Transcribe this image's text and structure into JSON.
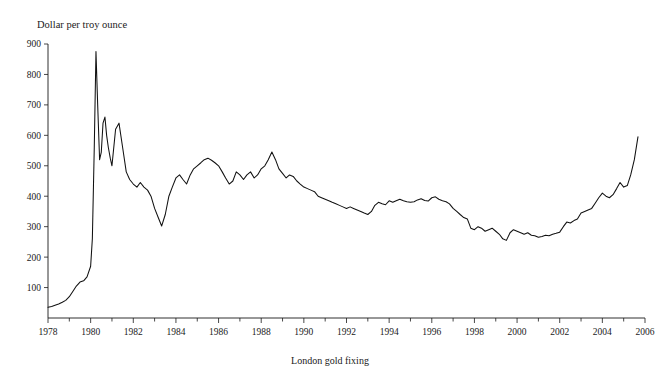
{
  "figure": {
    "title": "CHART 3: Movement in Gold Prices",
    "y_axis_caption": "Dollar per troy ounce",
    "x_axis_caption": "London gold fixing"
  },
  "chart_data": {
    "type": "line",
    "title": "CHART 3: Movement in Gold Prices",
    "subtitle": "",
    "xlabel": "London gold fixing",
    "ylabel": "Dollar per troy ounce",
    "xlim": [
      1978,
      2006
    ],
    "ylim": [
      0,
      900
    ],
    "grid": false,
    "legend": null,
    "x_major_ticks": [
      1978,
      1980,
      1982,
      1984,
      1986,
      1988,
      1990,
      1992,
      1994,
      1996,
      1998,
      2000,
      2002,
      2004,
      2006
    ],
    "x_tick_labels": [
      "1978",
      "1980",
      "1982",
      "1984",
      "1986",
      "1988",
      "1990",
      "1992",
      "1994",
      "1996",
      "1998",
      "2000",
      "2002",
      "2004",
      "2006"
    ],
    "x_minor_tick_interval": 1,
    "y_major_ticks": [
      100,
      200,
      300,
      400,
      500,
      600,
      700,
      800,
      900
    ],
    "y_tick_labels": [
      "100",
      "200",
      "300",
      "400",
      "500",
      "600",
      "700",
      "800",
      "900"
    ],
    "series": [
      {
        "name": "London gold fixing",
        "color": "#111111",
        "x": [
          1978.0,
          1978.17,
          1978.33,
          1978.5,
          1978.67,
          1978.83,
          1979.0,
          1979.17,
          1979.33,
          1979.5,
          1979.67,
          1979.83,
          1980.0,
          1980.08,
          1980.17,
          1980.25,
          1980.33,
          1980.42,
          1980.5,
          1980.58,
          1980.67,
          1980.75,
          1980.83,
          1980.92,
          1981.0,
          1981.17,
          1981.33,
          1981.5,
          1981.67,
          1981.83,
          1982.0,
          1982.17,
          1982.33,
          1982.5,
          1982.67,
          1982.83,
          1983.0,
          1983.17,
          1983.33,
          1983.5,
          1983.67,
          1983.83,
          1984.0,
          1984.17,
          1984.33,
          1984.5,
          1984.67,
          1984.83,
          1985.0,
          1985.17,
          1985.33,
          1985.5,
          1985.67,
          1985.83,
          1986.0,
          1986.17,
          1986.33,
          1986.5,
          1986.67,
          1986.83,
          1987.0,
          1987.17,
          1987.33,
          1987.5,
          1987.67,
          1987.83,
          1988.0,
          1988.17,
          1988.33,
          1988.5,
          1988.67,
          1988.83,
          1989.0,
          1989.17,
          1989.33,
          1989.5,
          1989.67,
          1989.83,
          1990.0,
          1990.17,
          1990.33,
          1990.5,
          1990.67,
          1990.83,
          1991.0,
          1991.17,
          1991.33,
          1991.5,
          1991.67,
          1991.83,
          1992.0,
          1992.17,
          1992.33,
          1992.5,
          1992.67,
          1992.83,
          1993.0,
          1993.17,
          1993.33,
          1993.5,
          1993.67,
          1993.83,
          1994.0,
          1994.17,
          1994.33,
          1994.5,
          1994.67,
          1994.83,
          1995.0,
          1995.17,
          1995.33,
          1995.5,
          1995.67,
          1995.83,
          1996.0,
          1996.17,
          1996.33,
          1996.5,
          1996.67,
          1996.83,
          1997.0,
          1997.17,
          1997.33,
          1997.5,
          1997.67,
          1997.83,
          1998.0,
          1998.17,
          1998.33,
          1998.5,
          1998.67,
          1998.83,
          1999.0,
          1999.17,
          1999.33,
          1999.5,
          1999.67,
          1999.83,
          2000.0,
          2000.17,
          2000.33,
          2000.5,
          2000.67,
          2000.83,
          2001.0,
          2001.17,
          2001.33,
          2001.5,
          2001.67,
          2001.83,
          2002.0,
          2002.17,
          2002.33,
          2002.5,
          2002.67,
          2002.83,
          2003.0,
          2003.17,
          2003.33,
          2003.5,
          2003.67,
          2003.83,
          2004.0,
          2004.17,
          2004.33,
          2004.5,
          2004.67,
          2004.83,
          2005.0,
          2005.17,
          2005.33,
          2005.5,
          2005.67
        ],
        "y": [
          35,
          38,
          42,
          46,
          52,
          58,
          70,
          88,
          105,
          118,
          122,
          135,
          170,
          260,
          560,
          875,
          700,
          520,
          545,
          640,
          660,
          600,
          560,
          525,
          500,
          620,
          640,
          560,
          480,
          455,
          440,
          430,
          445,
          430,
          420,
          400,
          360,
          330,
          302,
          340,
          400,
          430,
          460,
          470,
          455,
          440,
          470,
          490,
          500,
          510,
          520,
          525,
          518,
          510,
          500,
          480,
          460,
          440,
          450,
          480,
          470,
          455,
          470,
          480,
          460,
          470,
          490,
          500,
          520,
          545,
          520,
          490,
          475,
          460,
          470,
          465,
          450,
          440,
          430,
          425,
          420,
          415,
          400,
          395,
          390,
          385,
          380,
          375,
          370,
          365,
          360,
          365,
          360,
          355,
          350,
          345,
          340,
          350,
          370,
          380,
          375,
          372,
          385,
          380,
          385,
          390,
          385,
          382,
          380,
          382,
          388,
          392,
          386,
          384,
          395,
          398,
          390,
          385,
          382,
          375,
          360,
          350,
          340,
          330,
          325,
          295,
          290,
          300,
          295,
          285,
          290,
          295,
          285,
          275,
          260,
          255,
          280,
          290,
          285,
          280,
          275,
          280,
          272,
          270,
          265,
          268,
          272,
          270,
          275,
          278,
          282,
          300,
          315,
          312,
          320,
          325,
          345,
          350,
          355,
          360,
          378,
          395,
          410,
          400,
          395,
          405,
          425,
          445,
          430,
          435,
          470,
          520,
          595
        ]
      }
    ],
    "annotations": [
      {
        "label": "peak",
        "x": 1980.25,
        "y": 875
      },
      {
        "label": "1982 trough",
        "x": 1982.9,
        "y": 302
      },
      {
        "label": "2001 trough",
        "x": 2001.0,
        "y": 265
      },
      {
        "label": "end",
        "x": 2005.67,
        "y": 595
      }
    ]
  }
}
